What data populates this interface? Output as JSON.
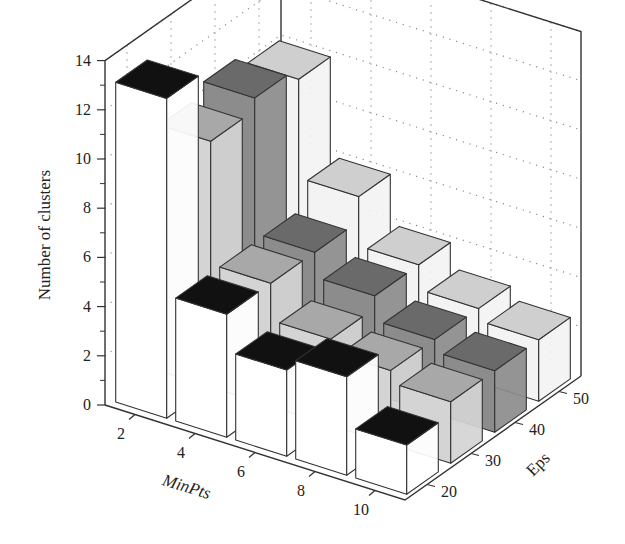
{
  "chart_data": {
    "type": "bar3d",
    "title": "",
    "xlabel": "MinPts",
    "ylabel": "Eps",
    "zlabel": "Number of clusters",
    "x_ticks": [
      2,
      4,
      6,
      8,
      10
    ],
    "y_ticks": [
      20,
      30,
      40,
      50
    ],
    "z_ticks": [
      0,
      2,
      4,
      6,
      8,
      10,
      12,
      14
    ],
    "zlim": [
      0,
      14
    ],
    "grid": true,
    "categories": [
      2,
      4,
      6,
      8,
      10
    ],
    "series": [
      {
        "name": "Eps=20",
        "eps": 20,
        "values": [
          13,
          5,
          3.5,
          4,
          2
        ],
        "side_color": "#ffffff",
        "top_color": "#111111"
      },
      {
        "name": "Eps=30",
        "eps": 30,
        "values": [
          10,
          5,
          3.5,
          3,
          2.5
        ],
        "side_color": "#d4d4d4",
        "top_color": "#a8a8a8"
      },
      {
        "name": "Eps=40",
        "eps": 40,
        "values": [
          10.5,
          5,
          4,
          3,
          2.5
        ],
        "side_color": "#8c8c8c",
        "top_color": "#6a6a6a"
      },
      {
        "name": "Eps=50",
        "eps": 50,
        "values": [
          10,
          6,
          4,
          3,
          2.5
        ],
        "side_color": "#f3f3f3",
        "top_color": "#cfcfcf"
      }
    ]
  }
}
